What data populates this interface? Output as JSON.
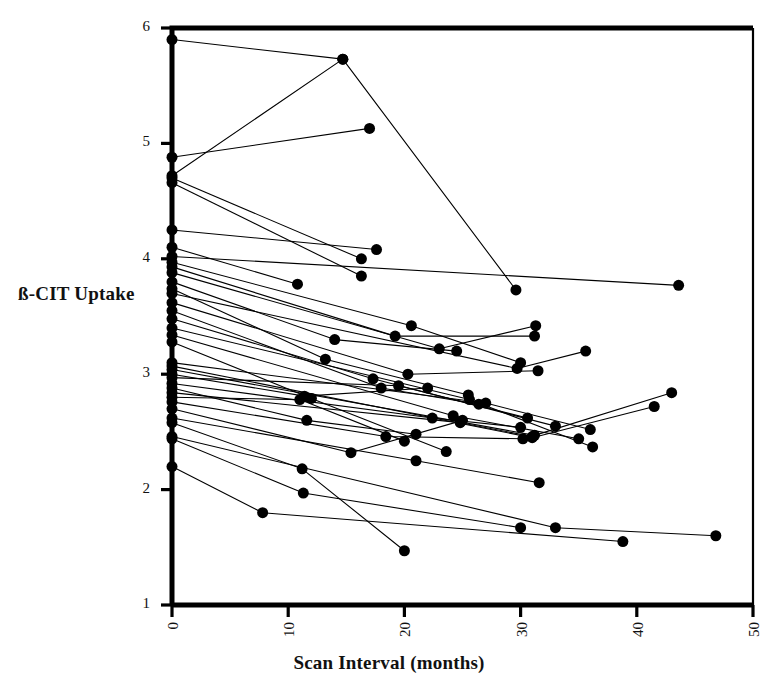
{
  "figure": {
    "kind": "scatter-line-spaghetti-plot",
    "background": "#ffffff",
    "ink_color": "#000000"
  },
  "labels": {
    "y_axis_title": "ß-CIT Uptake",
    "x_axis_title": "Scan Interval (months)"
  },
  "chart_data": {
    "type": "line",
    "title": "",
    "xlabel": "Scan Interval (months)",
    "ylabel": "ß-CIT Uptake",
    "xlim": [
      0,
      50
    ],
    "ylim": [
      1,
      6
    ],
    "xticks": [
      0,
      10,
      20,
      30,
      40,
      50
    ],
    "yticks": [
      1,
      2,
      3,
      4,
      5,
      6
    ],
    "xtick_labels": [
      "0",
      "10",
      "20",
      "30",
      "40",
      "50"
    ],
    "ytick_labels": [
      "1",
      "2",
      "3",
      "4",
      "5",
      "6"
    ],
    "grid": false,
    "legend": false,
    "legend_position": "none",
    "marker": "filled-circle",
    "marker_size_px": 11,
    "line_width_px": 1.1,
    "x_units": "months",
    "series": [
      {
        "name": "s01",
        "x": [
          0,
          14.7
        ],
        "y": [
          5.9,
          5.73
        ]
      },
      {
        "name": "s02",
        "x": [
          0,
          17.0
        ],
        "y": [
          4.88,
          5.13
        ]
      },
      {
        "name": "s03",
        "x": [
          0,
          14.7,
          29.6
        ],
        "y": [
          4.72,
          5.73,
          3.73
        ]
      },
      {
        "name": "s04",
        "x": [
          0,
          16.3
        ],
        "y": [
          4.7,
          4.0
        ]
      },
      {
        "name": "s05",
        "x": [
          0,
          16.3
        ],
        "y": [
          4.66,
          3.85
        ]
      },
      {
        "name": "s06",
        "x": [
          0,
          17.6
        ],
        "y": [
          4.25,
          4.08
        ]
      },
      {
        "name": "s07",
        "x": [
          0,
          10.8
        ],
        "y": [
          4.1,
          3.78
        ]
      },
      {
        "name": "s08",
        "x": [
          0,
          43.6
        ],
        "y": [
          4.02,
          3.77
        ]
      },
      {
        "name": "s09",
        "x": [
          0,
          20.6,
          30.0
        ],
        "y": [
          3.97,
          3.42,
          3.1
        ]
      },
      {
        "name": "s10",
        "x": [
          0,
          19.2,
          31.2
        ],
        "y": [
          3.93,
          3.33,
          3.33
        ]
      },
      {
        "name": "s11",
        "x": [
          0,
          23.0,
          31.3
        ],
        "y": [
          3.88,
          3.22,
          3.42
        ]
      },
      {
        "name": "s12",
        "x": [
          0,
          14.0,
          24.5
        ],
        "y": [
          3.8,
          3.3,
          3.2
        ]
      },
      {
        "name": "s13",
        "x": [
          0,
          13.2,
          25.5
        ],
        "y": [
          3.74,
          3.13,
          2.82
        ]
      },
      {
        "name": "s14",
        "x": [
          0,
          29.7,
          35.6
        ],
        "y": [
          3.7,
          3.05,
          3.2
        ]
      },
      {
        "name": "s15",
        "x": [
          0,
          20.3,
          31.5
        ],
        "y": [
          3.62,
          3.0,
          3.03
        ]
      },
      {
        "name": "s16",
        "x": [
          0,
          18.0,
          26.4
        ],
        "y": [
          3.55,
          2.88,
          2.74
        ]
      },
      {
        "name": "s17",
        "x": [
          0,
          17.3,
          33.0
        ],
        "y": [
          3.48,
          2.96,
          2.55
        ]
      },
      {
        "name": "s18",
        "x": [
          0,
          25.6,
          36.2
        ],
        "y": [
          3.4,
          2.78,
          2.37
        ]
      },
      {
        "name": "s19",
        "x": [
          0,
          24.2,
          35.0
        ],
        "y": [
          3.34,
          2.64,
          2.44
        ]
      },
      {
        "name": "s20",
        "x": [
          0,
          12.0,
          23.6
        ],
        "y": [
          3.28,
          2.79,
          2.33
        ]
      },
      {
        "name": "s21",
        "x": [
          0,
          27.0,
          36.0
        ],
        "y": [
          3.1,
          2.75,
          2.52
        ]
      },
      {
        "name": "s22",
        "x": [
          0,
          31.0,
          41.5
        ],
        "y": [
          3.07,
          2.45,
          2.72
        ]
      },
      {
        "name": "s23",
        "x": [
          0,
          31.2,
          43.0
        ],
        "y": [
          3.04,
          2.47,
          2.84
        ]
      },
      {
        "name": "s24",
        "x": [
          0,
          11.4,
          22.0
        ],
        "y": [
          3.0,
          2.81,
          2.88
        ]
      },
      {
        "name": "s25",
        "x": [
          0,
          19.5,
          30.6
        ],
        "y": [
          2.97,
          2.9,
          2.62
        ]
      },
      {
        "name": "s26",
        "x": [
          0,
          22.4,
          30.0
        ],
        "y": [
          2.92,
          2.62,
          2.54
        ]
      },
      {
        "name": "s27",
        "x": [
          0,
          11.6,
          21.0
        ],
        "y": [
          2.88,
          2.6,
          2.48
        ]
      },
      {
        "name": "s28",
        "x": [
          0,
          24.8,
          31.0
        ],
        "y": [
          2.84,
          2.58,
          2.46
        ]
      },
      {
        "name": "s29",
        "x": [
          0,
          11.0,
          20.0
        ],
        "y": [
          2.8,
          2.78,
          2.42
        ]
      },
      {
        "name": "s30",
        "x": [
          0,
          18.4,
          30.2
        ],
        "y": [
          2.76,
          2.46,
          2.44
        ]
      },
      {
        "name": "s31",
        "x": [
          0,
          15.4,
          25.0
        ],
        "y": [
          2.7,
          2.32,
          2.6
        ]
      },
      {
        "name": "s32",
        "x": [
          0,
          21.0,
          31.6
        ],
        "y": [
          2.62,
          2.25,
          2.06
        ]
      },
      {
        "name": "s33",
        "x": [
          0,
          11.2,
          20.0
        ],
        "y": [
          2.58,
          2.18,
          1.47
        ]
      },
      {
        "name": "s34",
        "x": [
          0,
          11.3,
          30.0
        ],
        "y": [
          2.44,
          1.97,
          1.67
        ]
      },
      {
        "name": "s35",
        "x": [
          0,
          7.8,
          38.8
        ],
        "y": [
          2.2,
          1.8,
          1.55
        ]
      },
      {
        "name": "s36",
        "x": [
          0,
          33.0,
          46.8
        ],
        "y": [
          2.46,
          1.67,
          1.6
        ]
      }
    ]
  }
}
